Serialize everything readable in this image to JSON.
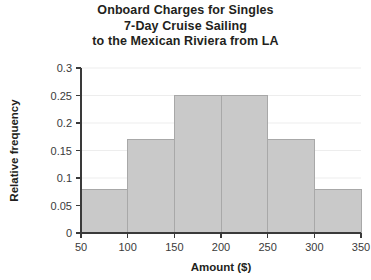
{
  "chart_data": {
    "type": "bar",
    "title": "Onboard Charges for Singles 7-Day Cruise Sailing to the Mexican Riviera from LA",
    "title_lines": [
      "Onboard Charges for Singles",
      "7-Day Cruise Sailing",
      "to the Mexican Riviera from LA"
    ],
    "xlabel": "Amount ($)",
    "ylabel": "Relative frequency",
    "bin_edges": [
      50,
      100,
      150,
      200,
      250,
      300,
      350
    ],
    "categories": [
      "50-100",
      "100-150",
      "150-200",
      "200-250",
      "250-300",
      "300-350"
    ],
    "values": [
      0.08,
      0.17,
      0.25,
      0.25,
      0.17,
      0.08
    ],
    "xlim": [
      50,
      350
    ],
    "ylim": [
      0,
      0.3
    ],
    "xticks": [
      50,
      100,
      150,
      200,
      250,
      300,
      350
    ],
    "xtick_labels": [
      "50",
      "100",
      "150",
      "200",
      "250",
      "300",
      "350"
    ],
    "yticks": [
      0,
      0.05,
      0.1,
      0.15,
      0.2,
      0.25,
      0.3
    ],
    "ytick_labels": [
      "0",
      "0.05",
      "0.1",
      "0.15",
      "0.2",
      "0.25",
      "0.3"
    ],
    "grid": true,
    "legend": false,
    "bar_fill": "#c9c9c9",
    "bar_edge": "#a8a8a8",
    "axis_color": "#3a3a3a",
    "grid_color": "#ededed"
  }
}
